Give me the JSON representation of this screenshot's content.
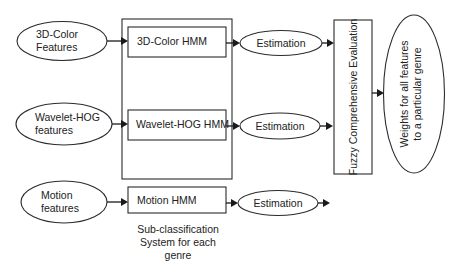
{
  "colors": {
    "stroke": "#2b2b2b",
    "text": "#222222",
    "background": "#ffffff"
  },
  "inputs": [
    {
      "id": "color",
      "line1": "3D-Color",
      "line2": "Features"
    },
    {
      "id": "wavelet",
      "line1": "Wavelet-HOG",
      "line2": "features"
    },
    {
      "id": "motion",
      "line1": "Motion",
      "line2": "features"
    }
  ],
  "hmms": [
    {
      "id": "color",
      "label": "3D-Color HMM"
    },
    {
      "id": "wavelet",
      "label": "Wavelet-HOG HMM"
    },
    {
      "id": "motion",
      "label": "Motion HMM"
    }
  ],
  "estimations": [
    {
      "label": "Estimation"
    },
    {
      "label": "Estimation"
    },
    {
      "label": "Estimation"
    }
  ],
  "subsystem_caption": {
    "line1": "Sub-classification",
    "line2": "System for each",
    "line3": "genre"
  },
  "fuzzy": {
    "label": "Fuzzy Comprehensive Evaluation"
  },
  "output": {
    "line1": "Weights for all features",
    "line2": "to a particular genre"
  }
}
